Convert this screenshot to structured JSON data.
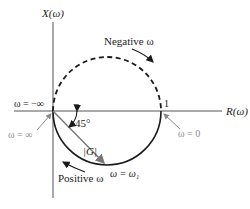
{
  "diagram": {
    "axes": {
      "vertical_label": "X(ω)",
      "horizontal_label": "R(ω)"
    },
    "labels": {
      "negative_omega": "Negative ω",
      "positive_omega": "Positive ω",
      "omega_neg_inf": "ω = −∞",
      "omega_pos_inf": "ω = ∞",
      "omega_zero": "ω = 0",
      "omega_one": "ω = ω₁",
      "angle": "45°",
      "magnitude": "|G|",
      "unit_point": "1"
    },
    "colors": {
      "curve": "#1a1a1a",
      "axis": "#555555",
      "vector": "#777777",
      "pointer": "#8a8a8a"
    }
  }
}
